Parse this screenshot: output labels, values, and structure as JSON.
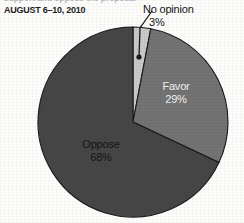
{
  "header": {
    "cropped_headline": "support and oppose the proposal",
    "date_line": "AUGUST 6–10, 2010"
  },
  "colors": {
    "background": "#fdfdfc",
    "no_opinion": "#c9c9c7",
    "favor": "#737373",
    "oppose": "#464646",
    "outline": "#1a1a1a",
    "text_dark": "#141414",
    "text_light": "#f2f2f0"
  },
  "chart_data": {
    "type": "pie",
    "title": "AUGUST 6–10, 2010",
    "categories": [
      "No opinion",
      "Favor",
      "Oppose"
    ],
    "values": [
      3,
      29,
      68
    ],
    "value_labels": [
      "3%",
      "29%",
      "68%"
    ],
    "colors": [
      "#c9c9c7",
      "#737373",
      "#464646"
    ],
    "unit": "percent",
    "start_angle_deg": 0,
    "direction": "clockwise",
    "legend": "none",
    "labels_placement": [
      "callout",
      "inside",
      "inside"
    ],
    "grid": false
  },
  "pie": {
    "center_x": 133,
    "center_y": 122,
    "radius": 95,
    "slices": [
      {
        "name": "No opinion",
        "percent_label": "3%",
        "start_deg": 0,
        "end_deg": 10.8,
        "fill": "#c9c9c7"
      },
      {
        "name": "Favor",
        "percent_label": "29%",
        "start_deg": 10.8,
        "end_deg": 115.2,
        "fill": "#737373"
      },
      {
        "name": "Oppose",
        "percent_label": "68%",
        "start_deg": 115.2,
        "end_deg": 360,
        "fill": "#464646"
      }
    ]
  },
  "callout": {
    "name": "No opinion",
    "percent_label": "3%",
    "dot_x": 139,
    "dot_y": 57,
    "line_from_x": 139,
    "line_from_y": 57,
    "line_to_x": 140,
    "line_to_y": 28,
    "elbow_x": 152,
    "elbow_y": 11
  },
  "labels": {
    "no_opinion_name": "No opinion",
    "no_opinion_pct": "3%",
    "favor_name": "Favor",
    "favor_pct": "29%",
    "oppose_name": "Oppose",
    "oppose_pct": "68%"
  }
}
